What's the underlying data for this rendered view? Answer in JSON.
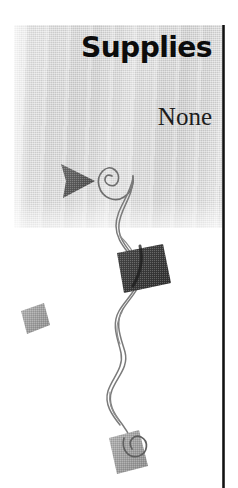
{
  "page": {
    "background_color": "#ffffff",
    "width": 238,
    "height": 488
  },
  "panel": {
    "name": "supplies-panel",
    "fill_color": "#d8d8d8",
    "texture": "scanned-halftone-gray"
  },
  "header": {
    "title": "Supplies",
    "title_color": "#0c0c0c"
  },
  "content": {
    "value": "None",
    "value_color": "#1d1d1d"
  },
  "divider": {
    "name": "right-vertical-rule",
    "color": "#111111"
  },
  "decorations": [
    {
      "name": "arrow-triangle",
      "shape": "triangle-right",
      "color": "#555555"
    },
    {
      "name": "spiral-curl-top",
      "shape": "spiral",
      "color": "#6b6b6b"
    },
    {
      "name": "ribbon-streamer",
      "shape": "twisting-double-curve",
      "color": "#777777"
    },
    {
      "name": "diamond-dark",
      "shape": "rotated-square",
      "color": "#3a3a3a"
    },
    {
      "name": "diamond-small-gray",
      "shape": "rotated-square",
      "color": "#9a9a9a"
    },
    {
      "name": "diamond-bottom-gray",
      "shape": "rotated-square",
      "color": "#a2a2a2"
    },
    {
      "name": "spiral-curl-bottom",
      "shape": "spiral",
      "color": "#6b6b6b"
    }
  ]
}
